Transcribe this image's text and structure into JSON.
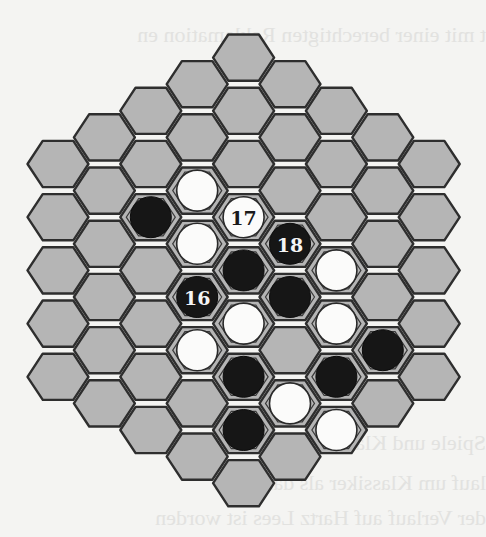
{
  "page": {
    "background": "#f4f4f2",
    "show_through_text": [
      {
        "text": "t mit einer berechtigten Reklamation en",
        "top": 22
      },
      {
        "text": "Spiele und Klassiker",
        "top": 430
      },
      {
        "text": "lauf um Klassiker als das Spiel",
        "top": 470
      },
      {
        "text": "der Verlauf auf Hartz Lees ist worden",
        "top": 505
      }
    ]
  },
  "board": {
    "type": "hex-hex",
    "side_length": 5,
    "orientation": "flat-top",
    "columns": [
      5,
      6,
      7,
      8,
      9,
      8,
      7,
      6,
      5
    ],
    "geometry": {
      "origin_x": 58,
      "col_spacing": 46.4,
      "top_center_y": 57.6,
      "half_row": 26.6,
      "row_spacing": 53.2,
      "hex_radius": 30.5,
      "stone_radius": 20.5
    },
    "colors": {
      "cell_fill": "#b5b5b5",
      "cell_stroke": "#2e2e2e",
      "black_stone": "#161616",
      "white_stone": "#fbfbfa"
    },
    "stones": [
      {
        "col": 2,
        "row": 2,
        "color": "black",
        "label": ""
      },
      {
        "col": 3,
        "row": 2,
        "color": "white",
        "label": ""
      },
      {
        "col": 3,
        "row": 3,
        "color": "white",
        "label": ""
      },
      {
        "col": 3,
        "row": 4,
        "color": "black",
        "label": "16"
      },
      {
        "col": 3,
        "row": 5,
        "color": "white",
        "label": ""
      },
      {
        "col": 4,
        "row": 3,
        "color": "white",
        "label": "17"
      },
      {
        "col": 4,
        "row": 4,
        "color": "black",
        "label": ""
      },
      {
        "col": 4,
        "row": 5,
        "color": "white",
        "label": ""
      },
      {
        "col": 4,
        "row": 6,
        "color": "black",
        "label": ""
      },
      {
        "col": 4,
        "row": 7,
        "color": "black",
        "label": ""
      },
      {
        "col": 5,
        "row": 3,
        "color": "black",
        "label": "18"
      },
      {
        "col": 5,
        "row": 4,
        "color": "black",
        "label": ""
      },
      {
        "col": 5,
        "row": 6,
        "color": "white",
        "label": ""
      },
      {
        "col": 6,
        "row": 3,
        "color": "white",
        "label": ""
      },
      {
        "col": 6,
        "row": 4,
        "color": "white",
        "label": ""
      },
      {
        "col": 6,
        "row": 5,
        "color": "black",
        "label": ""
      },
      {
        "col": 6,
        "row": 6,
        "color": "white",
        "label": ""
      },
      {
        "col": 7,
        "row": 4,
        "color": "black",
        "label": ""
      }
    ]
  }
}
